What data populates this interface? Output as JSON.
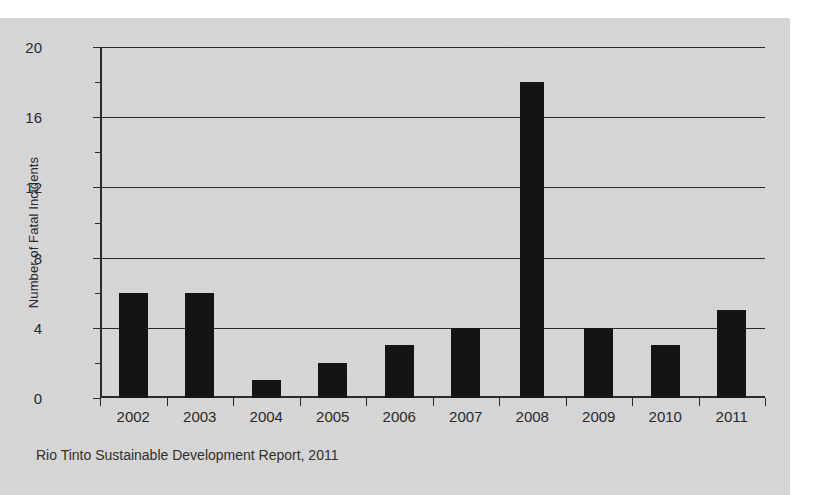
{
  "chart_data": {
    "type": "bar",
    "title": "",
    "xlabel": "",
    "ylabel": "Number of Fatal Incidents",
    "categories": [
      "2002",
      "2003",
      "2004",
      "2005",
      "2006",
      "2007",
      "2008",
      "2009",
      "2010",
      "2011"
    ],
    "values": [
      6,
      6,
      1,
      2,
      3,
      4,
      18,
      4,
      3,
      5
    ],
    "ylim": [
      0,
      20
    ],
    "ytick_labels": [
      "0",
      "4",
      "8",
      "12",
      "16",
      "20"
    ],
    "ytick_values": [
      0,
      4,
      8,
      12,
      16,
      20
    ],
    "grid": "horizontal",
    "legend": "none",
    "bar_color": "#141414",
    "background_color": "#d6d6d6",
    "axis_color": "#2b2b2b"
  },
  "caption": {
    "text": "Rio Tinto Sustainable Development Report, 2011"
  }
}
